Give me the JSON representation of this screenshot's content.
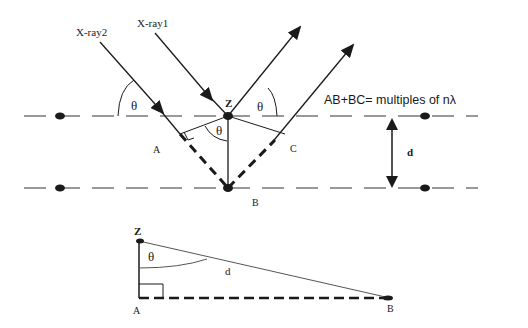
{
  "colors": {
    "stroke": "#1a1a1a",
    "plane": "#777777",
    "background": "#ffffff"
  },
  "rays": {
    "xray1_label": "X-ray1",
    "xray2_label": "X-ray2"
  },
  "angles": {
    "theta_incident": "θ",
    "theta_reflected": "θ",
    "theta_inner": "θ",
    "theta_triangle": "θ"
  },
  "points": {
    "z": "Z",
    "a": "A",
    "b": "B",
    "c": "C"
  },
  "spacing_label": "d",
  "equation": "AB+BC= multiples of nλ",
  "triangle": {
    "z": "Z",
    "a": "A",
    "b": "B",
    "d": "d",
    "theta": "θ"
  }
}
